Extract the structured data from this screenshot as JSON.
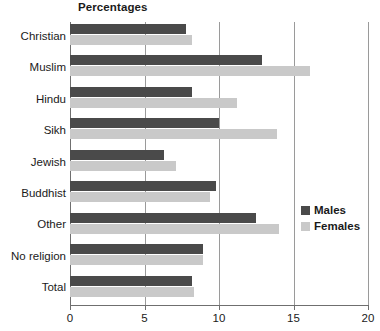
{
  "chart_data": {
    "type": "bar",
    "orientation": "horizontal",
    "title": "Percentages",
    "xlabel": "",
    "ylabel": "",
    "xlim": [
      0,
      20
    ],
    "xticks": [
      0,
      5,
      10,
      15,
      20
    ],
    "xtick_labels": [
      "0",
      "5",
      "10",
      "15",
      "20"
    ],
    "grid": true,
    "grid_axis": "x",
    "legend_position": "right",
    "categories": [
      "Christian",
      "Muslim",
      "Hindu",
      "Sikh",
      "Jewish",
      "Buddhist",
      "Other",
      "No religion",
      "Total"
    ],
    "series": [
      {
        "name": "Males",
        "color": "#4a4a4a",
        "values": [
          7.8,
          12.9,
          8.2,
          10.0,
          6.3,
          9.8,
          12.5,
          8.9,
          8.2
        ]
      },
      {
        "name": "Females",
        "color": "#c9c9c9",
        "values": [
          8.2,
          16.1,
          11.2,
          13.9,
          7.1,
          9.4,
          14.0,
          8.9,
          8.3
        ]
      }
    ]
  },
  "legend": {
    "items": [
      {
        "label": "Males",
        "color": "#4a4a4a"
      },
      {
        "label": "Females",
        "color": "#c9c9c9"
      }
    ]
  },
  "colors": {
    "males": "#4a4a4a",
    "females": "#c9c9c9",
    "axis": "#6f6f6f",
    "gridline": "#9a9a9a",
    "text": "#1a1a1a",
    "background": "#ffffff"
  }
}
